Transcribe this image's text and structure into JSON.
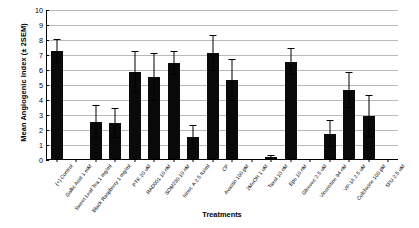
{
  "chart_data": {
    "type": "bar",
    "title": "",
    "xlabel": "Treatments",
    "ylabel": "Mean Angiogenic Index (± 2SEM)",
    "ylim": [
      0,
      10
    ],
    "ytick_labels": [
      "0",
      "1",
      "2",
      "3",
      "4",
      "5",
      "6",
      "7",
      "8",
      "9",
      "10"
    ],
    "grid": true,
    "legend": "none",
    "bar_color": "#0a0a0a",
    "categories": [
      "(+) Control",
      "Gallic Acid 1 mM",
      "Sweet Leaf Tea 1 mg/ml",
      "Black Raspberry 1 mg/ml",
      "PTK 20 uM",
      "RAD001 10 nM",
      "SOM230 10 nM",
      "Irinot. A 2.5 IU/ml",
      "CP",
      "Avastin 100 pM",
      "2MeOH 1 uM",
      "Taxol 10 nM",
      "Epo 10 nM",
      "Gleevec 2.5 uM",
      "Vincristine 94 nM",
      "VP-16 2.5 uM",
      "Colchicine 100 pM",
      "5FU 2.5 uM"
    ],
    "values": [
      7.2,
      0.0,
      2.5,
      2.4,
      5.8,
      5.5,
      6.4,
      1.5,
      7.1,
      5.3,
      0.0,
      0.15,
      6.5,
      0.0,
      1.7,
      4.6,
      2.9,
      0.0
    ],
    "errors": [
      0.8,
      0.0,
      1.1,
      1.0,
      1.4,
      1.6,
      0.8,
      0.8,
      1.2,
      1.4,
      0.0,
      0.1,
      0.9,
      0.0,
      0.9,
      1.2,
      1.4,
      0.0
    ]
  }
}
